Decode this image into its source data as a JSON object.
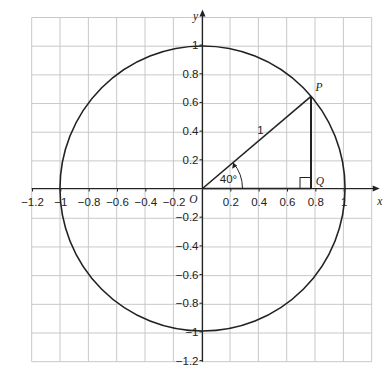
{
  "diagram": {
    "type": "unit-circle",
    "axes": {
      "x_label": "x",
      "y_label": "y",
      "origin_label": "O",
      "x_ticks": [
        "−1.2",
        "−1",
        "−0.8",
        "−0.6",
        "−0.4",
        "−0.2",
        "0.2",
        "0.4",
        "0.6",
        "0.8",
        "1"
      ],
      "y_ticks": [
        "1",
        "0.8",
        "0.6",
        "0.4",
        "0.2",
        "−0.2",
        "−0.4",
        "−0.6",
        "−0.8",
        "−1",
        "−1.2"
      ],
      "range": [
        -1.2,
        1.2
      ]
    },
    "circle": {
      "radius": 1,
      "center": [
        0,
        0
      ]
    },
    "points": {
      "P": {
        "label": "P",
        "x": 0.766,
        "y": 0.643
      },
      "Q": {
        "label": "Q",
        "x": 0.766,
        "y": 0
      }
    },
    "hypotenuse_label": "1",
    "angle_label": "40°",
    "angle_degrees": 40,
    "colors": {
      "grid": "#c8c8c8",
      "line": "#222222"
    }
  }
}
